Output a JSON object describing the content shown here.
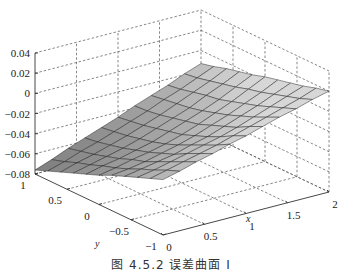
{
  "figure": {
    "caption": "图 4.5.2  误差曲面 I"
  },
  "chart_data": {
    "type": "surface",
    "title": "",
    "caption": "图 4.5.2  误差曲面 I",
    "xlabel": "x",
    "ylabel": "y",
    "zlabel": "",
    "xlim": [
      0,
      2
    ],
    "ylim": [
      -1,
      1
    ],
    "zlim": [
      -0.08,
      0.04
    ],
    "x_ticks": [
      "0",
      "0.5",
      "1",
      "1.5",
      "2"
    ],
    "y_ticks": [
      "1",
      "0.5",
      "0",
      "-0.5",
      "-1"
    ],
    "z_ticks": [
      "0.04",
      "0.02",
      "0",
      "-0.02",
      "-0.04",
      "-0.06",
      "-0.08"
    ],
    "grid": true,
    "colormap": "gray",
    "x": [
      0,
      0.2,
      0.4,
      0.6,
      0.8,
      1.0,
      1.2,
      1.4,
      1.6,
      1.8,
      2.0
    ],
    "y": [
      1,
      0.8,
      0.6,
      0.4,
      0.2,
      0,
      -0.2,
      -0.4,
      -0.6,
      -0.8,
      -1
    ],
    "z": [
      [
        -0.076,
        -0.07,
        -0.063,
        -0.057,
        -0.051,
        -0.045,
        -0.038,
        -0.032,
        -0.026,
        -0.019,
        -0.013
      ],
      [
        -0.071,
        -0.066,
        -0.06,
        -0.055,
        -0.049,
        -0.043,
        -0.037,
        -0.03,
        -0.024,
        -0.017,
        -0.01
      ],
      [
        -0.066,
        -0.061,
        -0.057,
        -0.052,
        -0.047,
        -0.041,
        -0.035,
        -0.028,
        -0.021,
        -0.014,
        -0.006
      ],
      [
        -0.061,
        -0.057,
        -0.053,
        -0.049,
        -0.044,
        -0.038,
        -0.032,
        -0.026,
        -0.018,
        -0.011,
        -0.003
      ],
      [
        -0.056,
        -0.052,
        -0.049,
        -0.045,
        -0.041,
        -0.035,
        -0.029,
        -0.023,
        -0.016,
        -0.008,
        0.0
      ],
      [
        -0.051,
        -0.048,
        -0.044,
        -0.041,
        -0.037,
        -0.032,
        -0.026,
        -0.019,
        -0.012,
        -0.004,
        0.004
      ],
      [
        -0.045,
        -0.043,
        -0.04,
        -0.036,
        -0.032,
        -0.027,
        -0.021,
        -0.015,
        -0.008,
        -0.001,
        0.007
      ],
      [
        -0.04,
        -0.037,
        -0.034,
        -0.031,
        -0.026,
        -0.022,
        -0.016,
        -0.01,
        -0.004,
        0.003,
        0.01
      ],
      [
        -0.035,
        -0.032,
        -0.028,
        -0.024,
        -0.02,
        -0.016,
        -0.011,
        -0.005,
        0.001,
        0.007,
        0.013
      ],
      [
        -0.03,
        -0.026,
        -0.022,
        -0.018,
        -0.014,
        -0.009,
        -0.004,
        0.001,
        0.006,
        0.011,
        0.017
      ],
      [
        -0.025,
        -0.021,
        -0.016,
        -0.012,
        -0.007,
        -0.003,
        0.002,
        0.007,
        0.011,
        0.016,
        0.02
      ]
    ]
  }
}
